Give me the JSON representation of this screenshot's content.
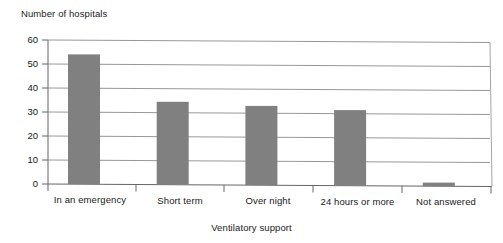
{
  "chart_data": {
    "type": "bar",
    "title": "",
    "xlabel": "Ventilatory support",
    "ylabel": "Number of hospitals",
    "categories": [
      "In an emergency",
      "Short term",
      "Over night",
      "24 hours or more",
      "Not answered"
    ],
    "values": [
      54,
      34.5,
      33,
      31.5,
      1.5
    ],
    "series": [
      {
        "name": "Number of hospitals",
        "values": [
          54,
          34.5,
          33,
          31.5,
          1.5
        ]
      }
    ],
    "ylim": [
      0,
      60
    ],
    "yticks": [
      0,
      10,
      20,
      30,
      40,
      50,
      60
    ],
    "ytick_labels": [
      "0",
      "10",
      "20",
      "30",
      "40",
      "50",
      "60"
    ],
    "grid": true,
    "grid_axis": "y",
    "legend": false,
    "legend_position": "none",
    "bar_color": "#808080",
    "axis_color": "#666666",
    "grid_color": "#8c8c8c",
    "background_color": "#ffffff"
  },
  "axes": {
    "y_title": "Number of hospitals",
    "x_title": "Ventilatory support"
  }
}
